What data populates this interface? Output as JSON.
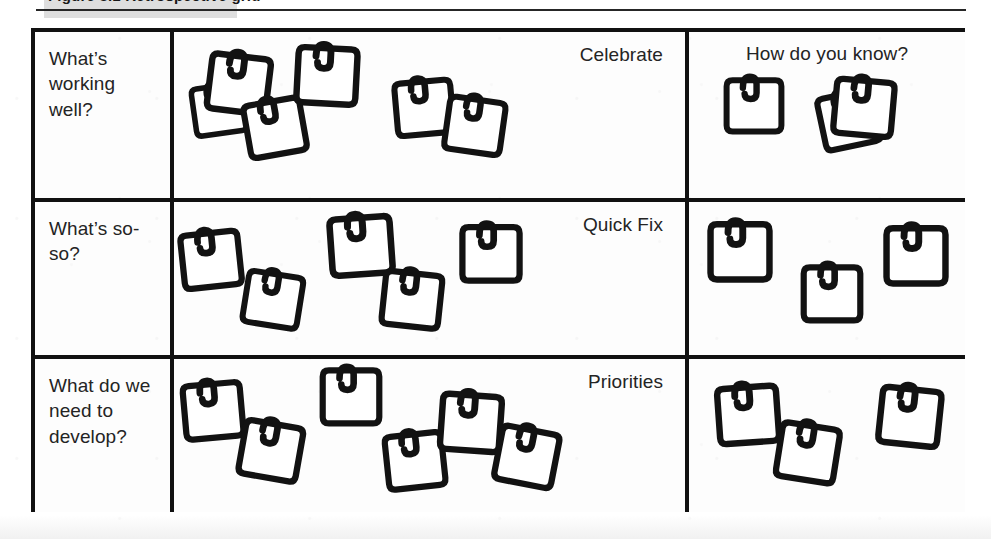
{
  "document": {
    "caption_partial": "Figure 3.1   Retrospective grid",
    "caption_highlighted": true
  },
  "grid": {
    "columns": [
      "",
      "",
      ""
    ],
    "rows": [
      {
        "prompt": "What’s working well?",
        "zone_label": "Celebrate",
        "zone_label_align": "right",
        "evidence_label": "How do you know?",
        "evidence_label_align": "center",
        "note_count_main": 6,
        "note_count_evidence": 3,
        "notes_main": [
          {
            "x": 10,
            "y": 42,
            "r": -8,
            "s": 0.86
          },
          {
            "x": 30,
            "y": 16,
            "r": 7,
            "s": 1.0
          },
          {
            "x": 66,
            "y": 60,
            "r": -10,
            "s": 0.96
          },
          {
            "x": 118,
            "y": 8,
            "r": 3,
            "s": 1.0
          },
          {
            "x": 215,
            "y": 40,
            "r": -5,
            "s": 0.95
          },
          {
            "x": 266,
            "y": 58,
            "r": 8,
            "s": 0.95
          }
        ],
        "notes_evidence": [
          {
            "x": 30,
            "y": 38,
            "r": 0,
            "s": 0.93
          },
          {
            "x": 125,
            "y": 52,
            "r": -12,
            "s": 0.95
          },
          {
            "x": 140,
            "y": 40,
            "r": 5,
            "s": 0.98
          }
        ]
      },
      {
        "prompt": "What’s so-so?",
        "zone_label": "Quick Fix",
        "zone_label_align": "right",
        "evidence_label": "",
        "evidence_label_align": "center",
        "note_count_main": 5,
        "note_count_evidence": 3,
        "notes_main": [
          {
            "x": 2,
            "y": 22,
            "r": -6,
            "s": 0.97
          },
          {
            "x": 64,
            "y": 62,
            "r": 9,
            "s": 0.93
          },
          {
            "x": 152,
            "y": 8,
            "r": -4,
            "s": 1.02
          },
          {
            "x": 203,
            "y": 62,
            "r": 6,
            "s": 0.96
          },
          {
            "x": 282,
            "y": 16,
            "r": 0,
            "s": 0.97
          }
        ],
        "notes_evidence": [
          {
            "x": 16,
            "y": 14,
            "r": 0,
            "s": 1.0
          },
          {
            "x": 108,
            "y": 56,
            "r": 0,
            "s": 0.96
          },
          {
            "x": 192,
            "y": 18,
            "r": 0,
            "s": 1.0
          }
        ]
      },
      {
        "prompt": "What do we need to develop?",
        "zone_label": "Priorities",
        "zone_label_align": "right",
        "evidence_label": "",
        "evidence_label_align": "center",
        "note_count_main": 6,
        "note_count_evidence": 3,
        "notes_main": [
          {
            "x": 4,
            "y": 16,
            "r": -5,
            "s": 0.97
          },
          {
            "x": 62,
            "y": 56,
            "r": 10,
            "s": 0.98
          },
          {
            "x": 142,
            "y": 2,
            "r": 0,
            "s": 0.96
          },
          {
            "x": 206,
            "y": 66,
            "r": -6,
            "s": 0.96
          },
          {
            "x": 262,
            "y": 28,
            "r": 4,
            "s": 1.0
          },
          {
            "x": 318,
            "y": 62,
            "r": 11,
            "s": 0.98
          }
        ],
        "notes_evidence": [
          {
            "x": 24,
            "y": 20,
            "r": -4,
            "s": 1.0
          },
          {
            "x": 84,
            "y": 58,
            "r": 9,
            "s": 0.98
          },
          {
            "x": 186,
            "y": 22,
            "r": 6,
            "s": 1.0
          }
        ]
      }
    ]
  },
  "icons": {
    "sticky_note": "sticky-note-with-clip-icon"
  },
  "colors": {
    "ink": "#121212",
    "paper": "#ffffff",
    "highlight": "#d8d8d8"
  }
}
